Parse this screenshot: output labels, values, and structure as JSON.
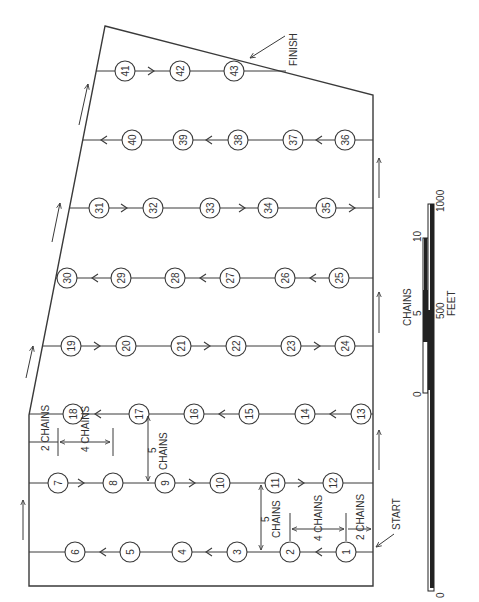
{
  "labels": {
    "start": "START",
    "finish": "FINISH",
    "two_chains_top": "2 CHAINS",
    "four_chains_top": "4 CHAINS",
    "five_chains_top": "5",
    "five_chains_top_unit": "CHAINS",
    "five_chains_bottom": "5",
    "five_chains_bottom_unit": "CHAINS",
    "four_chains_bottom": "4 CHAINS",
    "two_chains_bottom": "2 CHAINS"
  },
  "scale_bar": {
    "chains_label": "CHAINS",
    "feet_label": "FEET",
    "chains_ticks": [
      "0",
      "5",
      "10"
    ],
    "feet_ticks": [
      "0",
      "500",
      "1000"
    ]
  },
  "stations": [
    {
      "id": "1",
      "x": 346,
      "y": 552
    },
    {
      "id": "2",
      "x": 290,
      "y": 552
    },
    {
      "id": "3",
      "x": 237,
      "y": 552
    },
    {
      "id": "4",
      "x": 182,
      "y": 552
    },
    {
      "id": "5",
      "x": 130,
      "y": 552
    },
    {
      "id": "6",
      "x": 75,
      "y": 552
    },
    {
      "id": "7",
      "x": 58,
      "y": 483
    },
    {
      "id": "8",
      "x": 113,
      "y": 483
    },
    {
      "id": "9",
      "x": 165,
      "y": 483
    },
    {
      "id": "10",
      "x": 220,
      "y": 483
    },
    {
      "id": "11",
      "x": 275,
      "y": 483
    },
    {
      "id": "12",
      "x": 333,
      "y": 483
    },
    {
      "id": "13",
      "x": 361,
      "y": 414
    },
    {
      "id": "14",
      "x": 305,
      "y": 414
    },
    {
      "id": "15",
      "x": 249,
      "y": 414
    },
    {
      "id": "16",
      "x": 194,
      "y": 414
    },
    {
      "id": "17",
      "x": 139,
      "y": 414
    },
    {
      "id": "18",
      "x": 73,
      "y": 414
    },
    {
      "id": "19",
      "x": 71,
      "y": 346
    },
    {
      "id": "20",
      "x": 126,
      "y": 346
    },
    {
      "id": "21",
      "x": 181,
      "y": 346
    },
    {
      "id": "22",
      "x": 236,
      "y": 346
    },
    {
      "id": "23",
      "x": 291,
      "y": 346
    },
    {
      "id": "24",
      "x": 345,
      "y": 346
    },
    {
      "id": "25",
      "x": 339,
      "y": 278
    },
    {
      "id": "26",
      "x": 285,
      "y": 278
    },
    {
      "id": "27",
      "x": 230,
      "y": 278
    },
    {
      "id": "28",
      "x": 175,
      "y": 278
    },
    {
      "id": "29",
      "x": 121,
      "y": 278
    },
    {
      "id": "30",
      "x": 67,
      "y": 278
    },
    {
      "id": "31",
      "x": 99,
      "y": 208
    },
    {
      "id": "32",
      "x": 153,
      "y": 208
    },
    {
      "id": "33",
      "x": 210,
      "y": 208
    },
    {
      "id": "34",
      "x": 268,
      "y": 208
    },
    {
      "id": "35",
      "x": 326,
      "y": 208
    },
    {
      "id": "36",
      "x": 345,
      "y": 140
    },
    {
      "id": "37",
      "x": 293,
      "y": 140
    },
    {
      "id": "38",
      "x": 238,
      "y": 140
    },
    {
      "id": "39",
      "x": 183,
      "y": 140
    },
    {
      "id": "40",
      "x": 132,
      "y": 140
    },
    {
      "id": "41",
      "x": 125,
      "y": 71
    },
    {
      "id": "42",
      "x": 180,
      "y": 71
    },
    {
      "id": "43",
      "x": 234,
      "y": 71
    }
  ]
}
